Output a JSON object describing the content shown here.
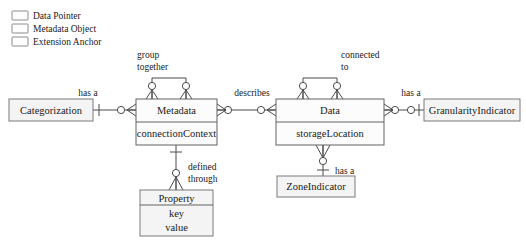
{
  "diagram": {
    "type": "entity-relationship-crowsfoot",
    "notation": "crow's foot (Information Engineering)",
    "legend": {
      "items": [
        {
          "label": "Data Pointer",
          "swatch_fill": "#fdfdfd",
          "swatch_stroke": "#8c8c8c"
        },
        {
          "label": "Metadata Object",
          "swatch_fill": "#fdfdfd",
          "swatch_stroke": "#8c8c8c"
        },
        {
          "label": "Extension Anchor",
          "swatch_fill": "#fdfdfd",
          "swatch_stroke": "#8c8c8c"
        }
      ]
    },
    "entities": [
      {
        "id": "categorization",
        "name": "Categorization",
        "attributes": []
      },
      {
        "id": "metadata",
        "name": "Metadata",
        "attributes": [
          "connectionContext"
        ]
      },
      {
        "id": "data",
        "name": "Data",
        "attributes": [
          "storageLocation"
        ]
      },
      {
        "id": "granularity_indicator",
        "name": "GranularityIndicator",
        "attributes": []
      },
      {
        "id": "property",
        "name": "Property",
        "attributes": [
          "key",
          "value"
        ]
      },
      {
        "id": "zone_indicator",
        "name": "ZoneIndicator",
        "attributes": []
      }
    ],
    "relationships": [
      {
        "id": "rel-categorization-metadata",
        "label": "has a",
        "from": "categorization",
        "to": "metadata"
      },
      {
        "id": "rel-metadata-self",
        "label": "group together",
        "from": "metadata",
        "to": "metadata"
      },
      {
        "id": "rel-metadata-data",
        "label": "describes",
        "from": "metadata",
        "to": "data"
      },
      {
        "id": "rel-data-self",
        "label": "connected to",
        "from": "data",
        "to": "data"
      },
      {
        "id": "rel-data-granularity",
        "label": "has a",
        "from": "data",
        "to": "granularity_indicator"
      },
      {
        "id": "rel-metadata-property",
        "label": "defined through",
        "from": "metadata",
        "to": "property"
      },
      {
        "id": "rel-data-zone",
        "label": "has a",
        "from": "data",
        "to": "zone_indicator"
      }
    ],
    "labels": {
      "has_a_categorization": "has a",
      "group_together_line1": "group",
      "group_together_line2": "together",
      "describes": "describes",
      "connected_to_line1": "connected",
      "connected_to_line2": "to",
      "has_a_granularity": "has a",
      "defined_through_line1": "defined",
      "defined_through_line2": "through",
      "has_a_zone": "has a"
    },
    "colors": {
      "box_fill": "#fcfcfc",
      "box_tinted_fill": "#f4f4f4",
      "line": "#4a4a4a",
      "text": "#1a1a1a"
    }
  }
}
